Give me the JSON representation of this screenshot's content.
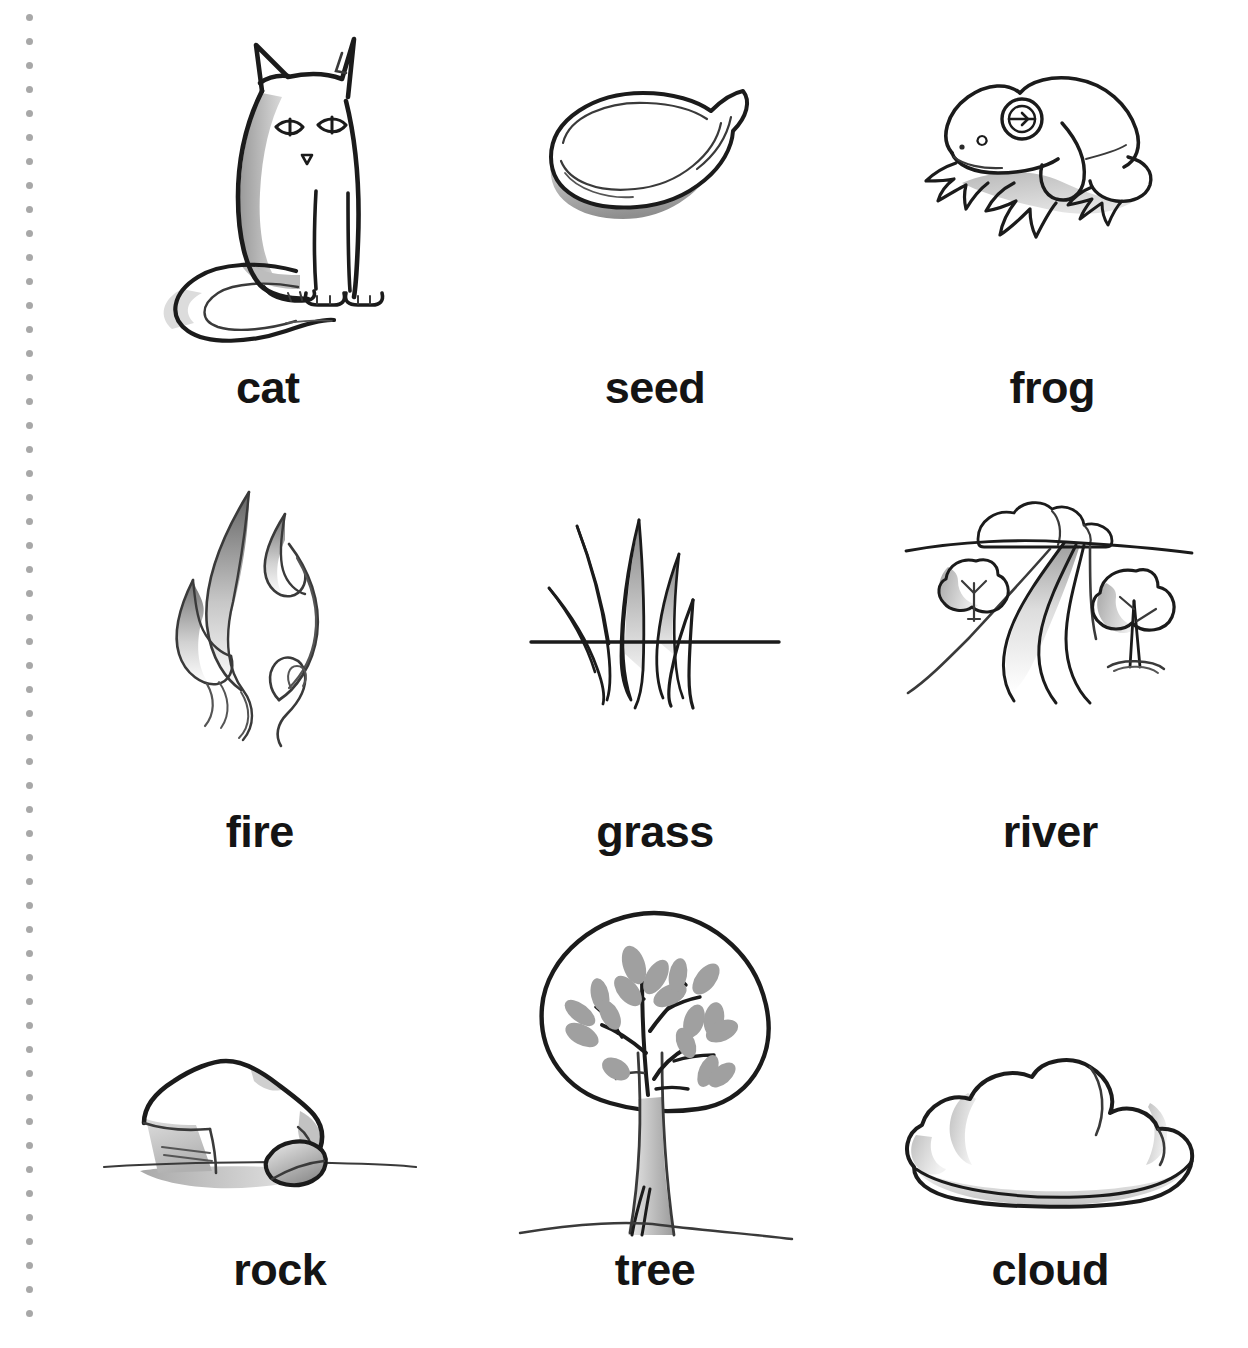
{
  "page": {
    "background_color": "#ffffff",
    "ink_color": "#1b1b1b",
    "label_color": "#141414",
    "margin_dot_color": "#a8a8a8",
    "margin_dot_count": 55,
    "margin_dot_spacing_px": 24,
    "columns": 3,
    "rows": 3
  },
  "cards": [
    {
      "id": "cat",
      "label": "cat",
      "icon": "cat-illustration",
      "row": 1,
      "column": 1
    },
    {
      "id": "seed",
      "label": "seed",
      "icon": "seed-illustration",
      "row": 1,
      "column": 2
    },
    {
      "id": "frog",
      "label": "frog",
      "icon": "frog-illustration",
      "row": 1,
      "column": 3
    },
    {
      "id": "fire",
      "label": "fire",
      "icon": "fire-illustration",
      "row": 2,
      "column": 1
    },
    {
      "id": "grass",
      "label": "grass",
      "icon": "grass-illustration",
      "row": 2,
      "column": 2
    },
    {
      "id": "river",
      "label": "river",
      "icon": "river-illustration",
      "row": 2,
      "column": 3
    },
    {
      "id": "rock",
      "label": "rock",
      "icon": "rock-illustration",
      "row": 3,
      "column": 1
    },
    {
      "id": "tree",
      "label": "tree",
      "icon": "tree-illustration",
      "row": 3,
      "column": 2
    },
    {
      "id": "cloud",
      "label": "cloud",
      "icon": "cloud-illustration",
      "row": 3,
      "column": 3
    }
  ]
}
